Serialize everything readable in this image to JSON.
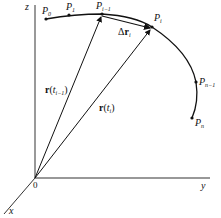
{
  "diagram": {
    "axes": {
      "z": "z",
      "y": "y",
      "x": "x",
      "origin": "0"
    },
    "points": [
      {
        "name": "P",
        "sub": "0"
      },
      {
        "name": "P",
        "sub": "1"
      },
      {
        "name": "P",
        "sub": "i−1"
      },
      {
        "name": "P",
        "sub": "i"
      },
      {
        "name": "P",
        "sub": "n−1"
      },
      {
        "name": "P",
        "sub": "n"
      }
    ],
    "vectors": {
      "r_prev": {
        "bold": "r",
        "open": "(",
        "var": "t",
        "sub": "i−1",
        "close": ")"
      },
      "r_i": {
        "bold": "r",
        "open": "(",
        "var": "t",
        "sub": "i",
        "close": ")"
      },
      "delta": {
        "prefix": "Δ",
        "bold": "r",
        "sub": "i"
      }
    },
    "colors": {
      "stroke": "#111111",
      "background": "#ffffff"
    }
  }
}
